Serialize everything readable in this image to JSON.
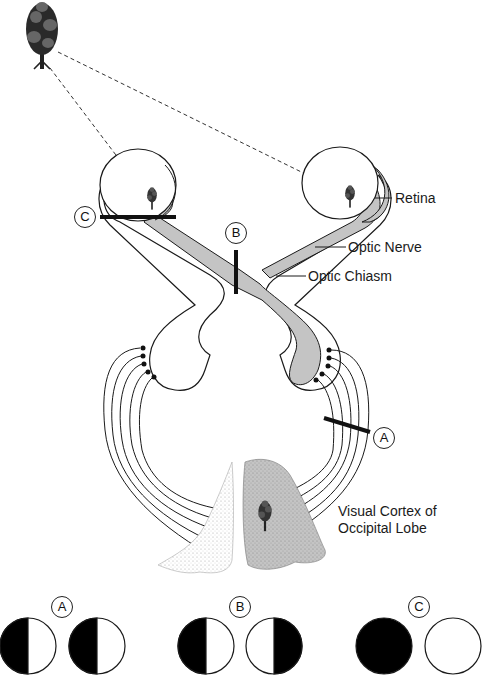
{
  "diagram": {
    "type": "visual pathway lesion diagram",
    "labels": {
      "retina": "Retina",
      "optic_nerve": "Optic Nerve",
      "optic_chiasm": "Optic Chiasm",
      "cortex_line1": "Visual Cortex of",
      "cortex_line2": "Occipital Lobe"
    },
    "lesion_markers": {
      "a": "A",
      "b": "B",
      "c": "C"
    },
    "visual_field_results": [
      {
        "marker": "A",
        "left_eye": "left half black",
        "right_eye": "left half black"
      },
      {
        "marker": "B",
        "left_eye": "left half black",
        "right_eye": "right half black"
      },
      {
        "marker": "C",
        "left_eye": "fully black",
        "right_eye": "fully white"
      }
    ],
    "colors": {
      "shaded_pathway": "#c4c4c4",
      "line": "#1a1a1a",
      "background": "#ffffff"
    }
  }
}
